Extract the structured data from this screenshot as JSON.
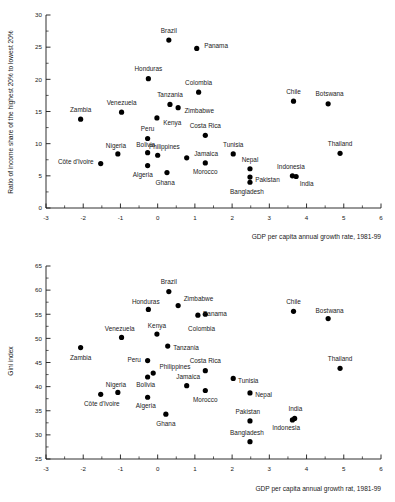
{
  "chart_data": [
    {
      "type": "scatter",
      "title": "",
      "xlabel": "GDP per capita annual growth rate, 1981-99",
      "ylabel": "Ratio of income share of the highest 20% to lowest 20%",
      "xlim": [
        -3,
        6
      ],
      "ylim": [
        0,
        30
      ],
      "xticks": [
        -3,
        -2,
        -1,
        0,
        1,
        2,
        3,
        4,
        5,
        6
      ],
      "yticks": [
        0,
        5,
        10,
        15,
        20,
        25,
        30
      ],
      "xtick_labels": [
        "-3",
        "-2",
        "-1",
        "0",
        "1",
        "2",
        "3",
        "4",
        "5",
        "6"
      ],
      "ytick_labels": [
        "0",
        "5",
        "10",
        "15",
        "20",
        "25",
        "30"
      ],
      "minor_tick_step": 0.5,
      "grid": false,
      "legend": "none",
      "points": [
        {
          "label": "Brazil",
          "x": 0.3,
          "y": 26.1,
          "lx": 0.3,
          "ly": 27.6,
          "anchor": "middle"
        },
        {
          "label": "Panama",
          "x": 1.05,
          "y": 24.8,
          "lx": 1.25,
          "ly": 25.3,
          "anchor": "start"
        },
        {
          "label": "Honduras",
          "x": -0.25,
          "y": 20.1,
          "lx": -0.25,
          "ly": 21.6,
          "anchor": "middle"
        },
        {
          "label": "Colombia",
          "x": 1.1,
          "y": 18.0,
          "lx": 1.1,
          "ly": 19.5,
          "anchor": "middle"
        },
        {
          "label": "Chile",
          "x": 3.65,
          "y": 16.6,
          "lx": 3.65,
          "ly": 18.1,
          "anchor": "middle"
        },
        {
          "label": "Botswana",
          "x": 4.58,
          "y": 16.2,
          "lx": 4.62,
          "ly": 17.7,
          "anchor": "middle"
        },
        {
          "label": "Tanzania",
          "x": 0.33,
          "y": 16.1,
          "lx": 0.33,
          "ly": 17.6,
          "anchor": "middle"
        },
        {
          "label": "Zimbabwe",
          "x": 0.55,
          "y": 15.6,
          "lx": 0.72,
          "ly": 15.2,
          "anchor": "start"
        },
        {
          "label": "Venezuela",
          "x": -0.97,
          "y": 14.9,
          "lx": -0.97,
          "ly": 16.4,
          "anchor": "middle"
        },
        {
          "label": "Kenya",
          "x": -0.02,
          "y": 14.0,
          "lx": 0.15,
          "ly": 13.2,
          "anchor": "start"
        },
        {
          "label": "Zambia",
          "x": -2.07,
          "y": 13.8,
          "lx": -2.07,
          "ly": 15.3,
          "anchor": "middle"
        },
        {
          "label": "Costa Rica",
          "x": 1.28,
          "y": 11.3,
          "lx": 1.28,
          "ly": 12.8,
          "anchor": "middle"
        },
        {
          "label": "Peru",
          "x": -0.27,
          "y": 10.8,
          "lx": -0.27,
          "ly": 12.3,
          "anchor": "middle"
        },
        {
          "label": "Thailand",
          "x": 4.9,
          "y": 8.5,
          "lx": 4.9,
          "ly": 10.0,
          "anchor": "middle"
        },
        {
          "label": "Bolivia",
          "x": -0.27,
          "y": 8.6,
          "lx": -0.32,
          "ly": 9.9,
          "anchor": "middle"
        },
        {
          "label": "Tunisia",
          "x": 2.03,
          "y": 8.4,
          "lx": 2.03,
          "ly": 9.8,
          "anchor": "middle"
        },
        {
          "label": "Nigeria",
          "x": -1.07,
          "y": 8.4,
          "lx": -1.12,
          "ly": 9.7,
          "anchor": "middle"
        },
        {
          "label": "Philippines",
          "x": 0.0,
          "y": 8.2,
          "lx": 0.18,
          "ly": 9.6,
          "anchor": "middle"
        },
        {
          "label": "Jamaica",
          "x": 0.78,
          "y": 7.8,
          "lx": 0.98,
          "ly": 8.5,
          "anchor": "start"
        },
        {
          "label": "Morocco",
          "x": 1.28,
          "y": 7.0,
          "lx": 1.28,
          "ly": 5.6,
          "anchor": "middle"
        },
        {
          "label": "Côte d'Ivoire",
          "x": -1.53,
          "y": 6.9,
          "lx": -1.72,
          "ly": 7.2,
          "anchor": "end"
        },
        {
          "label": "Algeria",
          "x": -0.27,
          "y": 6.6,
          "lx": -0.4,
          "ly": 5.2,
          "anchor": "middle"
        },
        {
          "label": "Nepal",
          "x": 2.48,
          "y": 6.1,
          "lx": 2.48,
          "ly": 7.5,
          "anchor": "middle"
        },
        {
          "label": "Ghana",
          "x": 0.25,
          "y": 5.5,
          "lx": 0.2,
          "ly": 4.0,
          "anchor": "middle"
        },
        {
          "label": "Indonesia",
          "x": 3.62,
          "y": 5.0,
          "lx": 3.58,
          "ly": 6.4,
          "anchor": "middle"
        },
        {
          "label": "India",
          "x": 3.72,
          "y": 4.9,
          "lx": 4.0,
          "ly": 3.7,
          "anchor": "middle"
        },
        {
          "label": "Pakistan",
          "x": 2.48,
          "y": 4.8,
          "lx": 2.62,
          "ly": 4.4,
          "anchor": "start"
        },
        {
          "label": "Bangladesh",
          "x": 2.48,
          "y": 4.0,
          "lx": 2.4,
          "ly": 2.5,
          "anchor": "middle"
        }
      ]
    },
    {
      "type": "scatter",
      "title": "",
      "xlabel": "GDP per capita annual growth rat, 1981-99",
      "ylabel": "Gini index",
      "xlim": [
        -3,
        6
      ],
      "ylim": [
        25,
        65
      ],
      "xticks": [
        -3,
        -2,
        -1,
        0,
        1,
        2,
        3,
        4,
        5,
        6
      ],
      "yticks": [
        25,
        30,
        35,
        40,
        45,
        50,
        55,
        60,
        65
      ],
      "xtick_labels": [
        "-3",
        "-2",
        "-1",
        "0",
        "1",
        "2",
        "3",
        "4",
        "5",
        "6"
      ],
      "ytick_labels": [
        "25",
        "30",
        "35",
        "40",
        "45",
        "50",
        "55",
        "60",
        "65"
      ],
      "minor_tick_step": 0.5,
      "grid": false,
      "legend": "none",
      "points": [
        {
          "label": "Brazil",
          "x": 0.3,
          "y": 59.7,
          "lx": 0.3,
          "ly": 61.7,
          "anchor": "middle"
        },
        {
          "label": "Zimbabwe",
          "x": 0.55,
          "y": 56.8,
          "lx": 0.7,
          "ly": 58.3,
          "anchor": "start"
        },
        {
          "label": "Honduras",
          "x": -0.25,
          "y": 56.0,
          "lx": -0.32,
          "ly": 57.6,
          "anchor": "middle"
        },
        {
          "label": "Chile",
          "x": 3.65,
          "y": 55.6,
          "lx": 3.65,
          "ly": 57.6,
          "anchor": "middle"
        },
        {
          "label": "Panama",
          "x": 1.08,
          "y": 54.8,
          "lx": 1.22,
          "ly": 55.2,
          "anchor": "start"
        },
        {
          "label": "Bostwana",
          "x": 4.58,
          "y": 54.1,
          "lx": 4.62,
          "ly": 55.8,
          "anchor": "middle"
        },
        {
          "label": "Colombia",
          "x": 1.28,
          "y": 55.0,
          "lx": 1.18,
          "ly": 52.0,
          "anchor": "middle"
        },
        {
          "label": "Kenya",
          "x": -0.02,
          "y": 50.9,
          "lx": -0.02,
          "ly": 52.6,
          "anchor": "middle"
        },
        {
          "label": "Venezuela",
          "x": -0.97,
          "y": 50.2,
          "lx": -1.02,
          "ly": 52.0,
          "anchor": "middle"
        },
        {
          "label": "Tanzania",
          "x": 0.27,
          "y": 48.4,
          "lx": 0.42,
          "ly": 48.0,
          "anchor": "start"
        },
        {
          "label": "Zambia",
          "x": -2.07,
          "y": 48.1,
          "lx": -2.07,
          "ly": 46.0,
          "anchor": "middle"
        },
        {
          "label": "Peru",
          "x": -0.27,
          "y": 45.4,
          "lx": -0.45,
          "ly": 45.6,
          "anchor": "end"
        },
        {
          "label": "Thailand",
          "x": 4.9,
          "y": 43.8,
          "lx": 4.9,
          "ly": 45.8,
          "anchor": "middle"
        },
        {
          "label": "Costa Rica",
          "x": 1.28,
          "y": 43.3,
          "lx": 1.28,
          "ly": 45.4,
          "anchor": "middle"
        },
        {
          "label": "Philippines",
          "x": -0.12,
          "y": 42.8,
          "lx": 0.05,
          "ly": 44.2,
          "anchor": "start"
        },
        {
          "label": "Bolivia",
          "x": -0.27,
          "y": 42.0,
          "lx": -0.32,
          "ly": 40.4,
          "anchor": "middle"
        },
        {
          "label": "Tunisia",
          "x": 2.03,
          "y": 41.7,
          "lx": 2.16,
          "ly": 41.3,
          "anchor": "start"
        },
        {
          "label": "Jamaica",
          "x": 0.78,
          "y": 40.2,
          "lx": 0.82,
          "ly": 42.0,
          "anchor": "middle"
        },
        {
          "label": "Morocco",
          "x": 1.28,
          "y": 39.2,
          "lx": 1.28,
          "ly": 37.2,
          "anchor": "middle"
        },
        {
          "label": "Nigeria",
          "x": -1.07,
          "y": 38.8,
          "lx": -1.12,
          "ly": 40.4,
          "anchor": "middle"
        },
        {
          "label": "Nepal",
          "x": 2.48,
          "y": 38.7,
          "lx": 2.62,
          "ly": 38.3,
          "anchor": "start"
        },
        {
          "label": "Côte d'Ivoire",
          "x": -1.53,
          "y": 38.4,
          "lx": -1.5,
          "ly": 36.4,
          "anchor": "middle"
        },
        {
          "label": "Algeria",
          "x": -0.27,
          "y": 37.8,
          "lx": -0.32,
          "ly": 36.0,
          "anchor": "middle"
        },
        {
          "label": "Ghana",
          "x": 0.22,
          "y": 34.3,
          "lx": 0.22,
          "ly": 32.3,
          "anchor": "middle"
        },
        {
          "label": "India",
          "x": 3.68,
          "y": 33.4,
          "lx": 3.7,
          "ly": 35.4,
          "anchor": "middle"
        },
        {
          "label": "Indonesia",
          "x": 3.62,
          "y": 33.1,
          "lx": 3.45,
          "ly": 31.4,
          "anchor": "middle"
        },
        {
          "label": "Pakistan",
          "x": 2.48,
          "y": 32.9,
          "lx": 2.42,
          "ly": 34.9,
          "anchor": "middle"
        },
        {
          "label": "Bangladesh",
          "x": 2.48,
          "y": 28.6,
          "lx": 2.4,
          "ly": 30.5,
          "anchor": "middle"
        }
      ]
    }
  ]
}
